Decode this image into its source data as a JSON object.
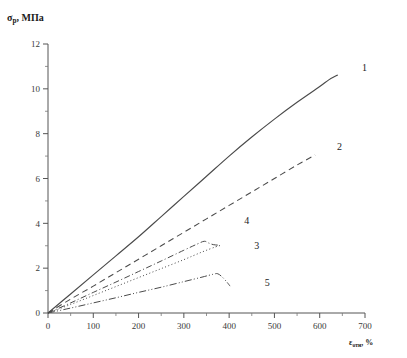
{
  "chart_data": {
    "type": "line",
    "title": "",
    "xlabel": "εотн, %",
    "ylabel": "σр, МПа",
    "xlim": [
      0,
      700
    ],
    "ylim": [
      0,
      12
    ],
    "xticks": [
      0,
      100,
      200,
      300,
      400,
      500,
      600,
      700
    ],
    "yticks": [
      0,
      2,
      4,
      6,
      8,
      10,
      12
    ],
    "xtick_minor_step": 50,
    "ytick_minor_step": 1,
    "grid": false,
    "legend_position": "inline-right-of-curve-ends",
    "series": [
      {
        "name": "1",
        "label": "1",
        "style": "solid",
        "color": "#4a4a4a",
        "points": [
          [
            0,
            0
          ],
          [
            50,
            0.85
          ],
          [
            100,
            1.7
          ],
          [
            150,
            2.55
          ],
          [
            200,
            3.4
          ],
          [
            250,
            4.3
          ],
          [
            300,
            5.2
          ],
          [
            350,
            6.1
          ],
          [
            400,
            7.0
          ],
          [
            450,
            7.85
          ],
          [
            500,
            8.65
          ],
          [
            550,
            9.4
          ],
          [
            600,
            10.1
          ],
          [
            620,
            10.4
          ],
          [
            640,
            10.62
          ]
        ]
      },
      {
        "name": "2",
        "label": "2",
        "style": "dashed",
        "color": "#4a4a4a",
        "points": [
          [
            0,
            0
          ],
          [
            50,
            0.62
          ],
          [
            100,
            1.2
          ],
          [
            150,
            1.8
          ],
          [
            200,
            2.4
          ],
          [
            250,
            3.0
          ],
          [
            300,
            3.6
          ],
          [
            350,
            4.2
          ],
          [
            400,
            4.8
          ],
          [
            450,
            5.4
          ],
          [
            500,
            6.0
          ],
          [
            550,
            6.6
          ],
          [
            590,
            7.05
          ]
        ]
      },
      {
        "name": "3",
        "label": "3",
        "style": "dotted",
        "color": "#4a4a4a",
        "points": [
          [
            0,
            0
          ],
          [
            50,
            0.38
          ],
          [
            100,
            0.78
          ],
          [
            150,
            1.18
          ],
          [
            200,
            1.58
          ],
          [
            250,
            1.98
          ],
          [
            300,
            2.38
          ],
          [
            340,
            2.72
          ],
          [
            370,
            2.95
          ],
          [
            382,
            3.02
          ]
        ]
      },
      {
        "name": "4",
        "label": "4",
        "style": "dash-dot",
        "color": "#4a4a4a",
        "points": [
          [
            0,
            0
          ],
          [
            50,
            0.45
          ],
          [
            100,
            0.92
          ],
          [
            150,
            1.38
          ],
          [
            200,
            1.85
          ],
          [
            250,
            2.32
          ],
          [
            300,
            2.8
          ],
          [
            330,
            3.08
          ],
          [
            345,
            3.2
          ],
          [
            355,
            3.12
          ],
          [
            365,
            3.05
          ],
          [
            380,
            3.02
          ]
        ]
      },
      {
        "name": "5",
        "label": "5",
        "style": "dash-dot-dot",
        "color": "#4a4a4a",
        "points": [
          [
            0,
            0
          ],
          [
            50,
            0.22
          ],
          [
            100,
            0.45
          ],
          [
            150,
            0.68
          ],
          [
            200,
            0.92
          ],
          [
            250,
            1.15
          ],
          [
            300,
            1.4
          ],
          [
            340,
            1.6
          ],
          [
            365,
            1.73
          ],
          [
            375,
            1.75
          ],
          [
            385,
            1.6
          ],
          [
            395,
            1.38
          ],
          [
            402,
            1.2
          ]
        ]
      }
    ],
    "annotations": [
      {
        "text": "1",
        "x": 700,
        "y": 10.9
      },
      {
        "text": "2",
        "x": 645,
        "y": 7.35
      },
      {
        "text": "4",
        "x": 440,
        "y": 4.05
      },
      {
        "text": "3",
        "x": 462,
        "y": 2.95
      },
      {
        "text": "5",
        "x": 485,
        "y": 1.3
      }
    ]
  }
}
